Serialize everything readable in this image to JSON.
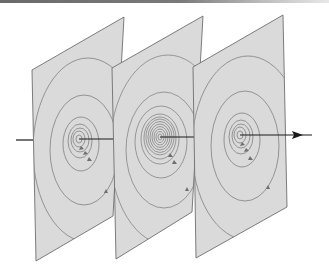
{
  "diagram": {
    "colors": {
      "plane_fill": "#dadada",
      "plane_edge": "#6e6e6e",
      "spiral": "#8a8a8a",
      "axis": "#1a1a1a",
      "background": "#ffffff"
    },
    "planes": [
      {
        "id": "plane-1",
        "corners": [
          [
            32,
            70
          ],
          [
            124,
            17
          ],
          [
            113,
            216
          ],
          [
            36,
            261
          ]
        ],
        "center": [
          79,
          139
        ],
        "rings": 6
      },
      {
        "id": "plane-2",
        "corners": [
          [
            112,
            68
          ],
          [
            203,
            16
          ],
          [
            192,
            212
          ],
          [
            116,
            259
          ]
        ],
        "center": [
          160,
          137
        ],
        "rings": 12
      },
      {
        "id": "plane-3",
        "corners": [
          [
            193,
            67
          ],
          [
            283,
            15
          ],
          [
            287,
            207
          ],
          [
            196,
            258
          ]
        ],
        "center": [
          240,
          135
        ],
        "rings": 6
      }
    ],
    "axis": {
      "start": [
        16,
        140
      ],
      "end": [
        312,
        135
      ],
      "direction": "arrow-right"
    }
  }
}
